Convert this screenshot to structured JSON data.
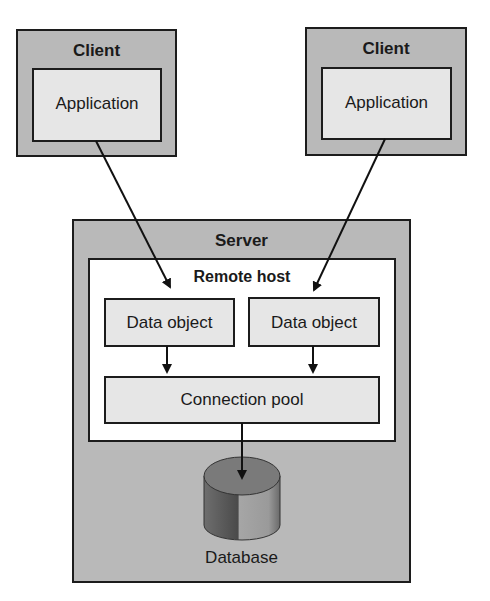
{
  "diagram": {
    "clients": [
      {
        "title": "Client",
        "app_label": "Application"
      },
      {
        "title": "Client",
        "app_label": "Application"
      }
    ],
    "server": {
      "title": "Server",
      "remote_host": {
        "title": "Remote host",
        "data_objects": [
          "Data object",
          "Data object"
        ],
        "connection_pool": "Connection pool"
      },
      "database": {
        "label": "Database",
        "icon": "database-cylinder-icon"
      }
    },
    "colors": {
      "container_fill": "#b9b9b9",
      "node_fill": "#e6e6e6",
      "host_fill": "#ffffff",
      "stroke": "#1c1c1c"
    },
    "edges": [
      {
        "from": "clients.0.app",
        "to": "data_objects.0"
      },
      {
        "from": "clients.1.app",
        "to": "data_objects.1"
      },
      {
        "from": "data_objects.0",
        "to": "connection_pool"
      },
      {
        "from": "data_objects.1",
        "to": "connection_pool"
      },
      {
        "from": "connection_pool",
        "to": "database"
      }
    ]
  }
}
